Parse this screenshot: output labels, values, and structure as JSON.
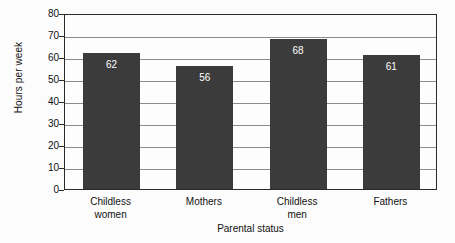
{
  "chart_data": {
    "type": "bar",
    "title": "",
    "xlabel": "Parental status",
    "ylabel": "Hours per week",
    "categories": [
      "Childless women",
      "Mothers",
      "Childless men",
      "Fathers"
    ],
    "category_lines": [
      [
        "Childless",
        "women"
      ],
      [
        "Mothers",
        ""
      ],
      [
        "Childless",
        "men"
      ],
      [
        "Fathers",
        ""
      ]
    ],
    "values": [
      62,
      56,
      68,
      61
    ],
    "value_labels": [
      "62",
      "56",
      "68",
      "61"
    ],
    "ylim": [
      0,
      80
    ],
    "yticks": [
      0,
      10,
      20,
      30,
      40,
      50,
      60,
      70,
      80
    ],
    "ytick_labels": [
      "0",
      "10",
      "20",
      "30",
      "40",
      "50",
      "60",
      "70",
      "80"
    ],
    "grid": true,
    "legend": "none",
    "colors": {
      "bar": "#3b3b3b",
      "value_label": "#ffffff",
      "gridline": "#8c8c8c",
      "frame": "#2a2a2a",
      "background": "#fcfcfc",
      "plot_background": "#fdfdfd",
      "text": "#111111"
    }
  }
}
